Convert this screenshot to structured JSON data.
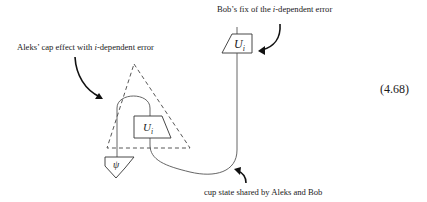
{
  "labels": {
    "bob_fix": {
      "prefix": "Bob’s fix of the ",
      "italic": "i",
      "suffix": "-dependent error"
    },
    "aleks_cap": {
      "prefix": "Aleks’ cap effect with ",
      "italic": "i",
      "suffix": "-dependent error"
    },
    "cup_state": "cup state shared by Aleks and Bob"
  },
  "equation_number": "(4.68)",
  "boxes": {
    "bob_unitary": {
      "main": "U",
      "sub": "i"
    },
    "aleks_unitary": {
      "main": "U",
      "sub": "i"
    },
    "state": "ψ"
  },
  "colors": {
    "line": "#3a3a3a",
    "text": "#1a1a1a",
    "background": "#ffffff"
  }
}
